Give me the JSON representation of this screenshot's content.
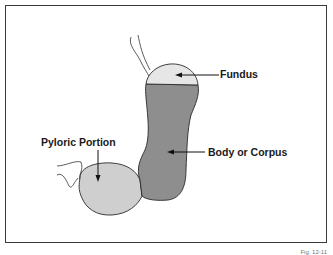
{
  "diagram": {
    "labels": {
      "fundus": "Fundus",
      "body": "Body or Corpus",
      "pyloric": "Pyloric Portion"
    },
    "caption": "Fig. 12-11",
    "colors": {
      "fundus_fill": "#e6e6e6",
      "body_fill": "#8e8e8e",
      "pyloric_fill": "#cfcfcf",
      "outline": "#2a2a2a"
    }
  }
}
